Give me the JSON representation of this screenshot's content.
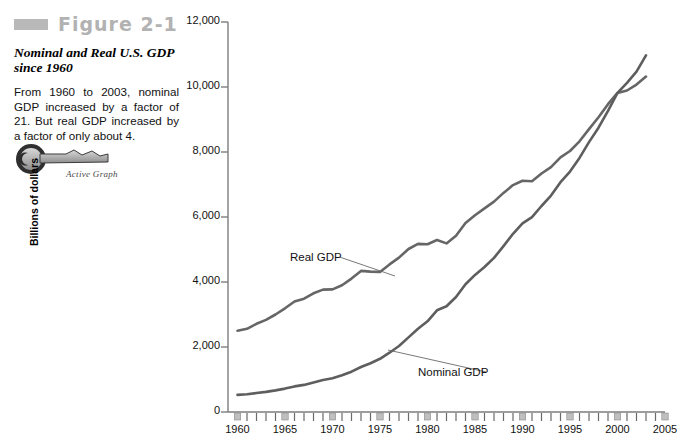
{
  "figure": {
    "swatch_color": "#b9b9b9",
    "label": "Figure 2-1",
    "subtitle": "Nominal and Real U.S. GDP since 1960",
    "body": "From 1960 to 2003, nominal GDP increased by a factor of 21. But real GDP increased by a factor of only about 4.",
    "active_graph_label": "Active Graph"
  },
  "chart_data": {
    "type": "line",
    "title": "Nominal and Real U.S. GDP since 1960",
    "xlabel": "",
    "ylabel": "Billions of dollars",
    "xlim": [
      1959,
      2005
    ],
    "ylim": [
      0,
      12000
    ],
    "grid": false,
    "legend_position": "inline-annotations",
    "ytick_labels": [
      "0",
      "2,000",
      "4,000",
      "6,000",
      "8,000",
      "10,000",
      "12,000"
    ],
    "ytick_values": [
      0,
      2000,
      4000,
      6000,
      8000,
      10000,
      12000
    ],
    "xtick_labels": [
      "1960",
      "1965",
      "1970",
      "1975",
      "1980",
      "1985",
      "1990",
      "1995",
      "2000",
      "2005"
    ],
    "xtick_values": [
      1960,
      1965,
      1970,
      1975,
      1980,
      1985,
      1990,
      1995,
      2000,
      2005
    ],
    "x": [
      1960,
      1961,
      1962,
      1963,
      1964,
      1965,
      1966,
      1967,
      1968,
      1969,
      1970,
      1971,
      1972,
      1973,
      1974,
      1975,
      1976,
      1977,
      1978,
      1979,
      1980,
      1981,
      1982,
      1983,
      1984,
      1985,
      1986,
      1987,
      1988,
      1989,
      1990,
      1991,
      1992,
      1993,
      1994,
      1995,
      1996,
      1997,
      1998,
      1999,
      2000,
      2001,
      2002,
      2003
    ],
    "series": [
      {
        "name": "Real GDP",
        "color": "#666666",
        "label_text": "Real GDP",
        "values": [
          2502,
          2560,
          2715,
          2834,
          2999,
          3191,
          3399,
          3485,
          3653,
          3766,
          3772,
          3899,
          4105,
          4342,
          4320,
          4311,
          4541,
          4751,
          5015,
          5173,
          5162,
          5292,
          5189,
          5424,
          5814,
          6054,
          6264,
          6475,
          6743,
          6981,
          7113,
          7101,
          7337,
          7533,
          7836,
          8032,
          8329,
          8704,
          9067,
          9470,
          9817,
          9891,
          10075,
          10321
        ]
      },
      {
        "name": "Nominal GDP",
        "color": "#5e5e5e",
        "label_text": "Nominal GDP",
        "values": [
          526,
          545,
          586,
          618,
          664,
          719,
          788,
          833,
          910,
          985,
          1039,
          1128,
          1241,
          1386,
          1501,
          1636,
          1824,
          2031,
          2295,
          2563,
          2790,
          3128,
          3255,
          3537,
          3933,
          4220,
          4463,
          4740,
          5104,
          5484,
          5803,
          5996,
          6338,
          6657,
          7072,
          7398,
          7817,
          8304,
          8747,
          9268,
          9817,
          10128,
          10470,
          10971
        ]
      }
    ],
    "annotations": [
      {
        "text": "Real GDP",
        "x_px": 290,
        "y_px": 251,
        "leader_to_x": 395,
        "leader_to_y": 276
      },
      {
        "text": "Nominal GDP",
        "x_px": 418,
        "y_px": 366,
        "leader_to_x": 388,
        "leader_to_y": 350
      }
    ]
  }
}
